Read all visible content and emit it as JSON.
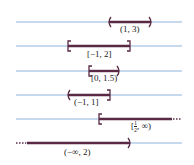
{
  "diagram": {
    "type": "number-line-intervals",
    "colors": {
      "axis": "#8fb3d9",
      "interval": "#5a2a45"
    },
    "rows": [
      {
        "label": "(1, 3)",
        "left": "open",
        "right": "open",
        "x1": 109,
        "x2": 151,
        "y": 22,
        "label_x": 120,
        "label_y": 28
      },
      {
        "label": "[−1, 2]",
        "left": "closed",
        "right": "closed",
        "x1": 68,
        "x2": 130,
        "y": 46,
        "label_x": 87,
        "label_y": 52
      },
      {
        "label": "[0, 1.5)",
        "left": "closed",
        "right": "open",
        "x1": 89,
        "x2": 119,
        "y": 71,
        "label_x": 91,
        "label_y": 77
      },
      {
        "label": "(−1, 1]",
        "left": "open",
        "right": "closed",
        "x1": 68,
        "x2": 110,
        "y": 95,
        "label_x": 74,
        "label_y": 100
      },
      {
        "label_parts": {
          "open": "[",
          "num": "1",
          "den": "2",
          "rest": ", ∞)"
        },
        "left": "closed",
        "right": "infinite",
        "x1": 99,
        "x2": 182,
        "y": 119,
        "label_x": 131,
        "label_y": 123
      },
      {
        "label": "(−∞, 2)",
        "left": "infinite",
        "right": "open",
        "x1": 16,
        "x2": 130,
        "y": 143,
        "label_x": 64,
        "label_y": 151
      }
    ]
  }
}
